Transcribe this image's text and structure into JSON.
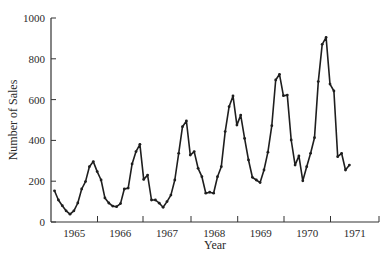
{
  "chart_data": {
    "type": "line",
    "title": "",
    "xlabel": "Year",
    "ylabel": "Number of Sales",
    "ylim": [
      0,
      1000
    ],
    "yticks": [
      0,
      200,
      400,
      600,
      800,
      1000
    ],
    "ytick_labels": [
      "0",
      "200",
      "400",
      "600",
      "800",
      "1000"
    ],
    "xtick_labels": [
      "1965",
      "1966",
      "1967",
      "1968",
      "1969",
      "1970",
      "1971"
    ],
    "x_start": "Jan 1965",
    "x_interval": "monthly",
    "grid": false,
    "legend": null,
    "colors": {
      "line": "#1e1e1e",
      "axis": "#333333"
    },
    "series": [
      {
        "name": "Number of Sales",
        "values": [
          153,
          108,
          80,
          55,
          38,
          55,
          93,
          162,
          198,
          271,
          296,
          247,
          206,
          118,
          93,
          78,
          75,
          90,
          162,
          166,
          285,
          345,
          381,
          209,
          230,
          108,
          108,
          92,
          72,
          100,
          132,
          206,
          337,
          467,
          495,
          328,
          345,
          263,
          222,
          141,
          146,
          141,
          222,
          271,
          443,
          565,
          618,
          475,
          524,
          410,
          304,
          219,
          206,
          193,
          255,
          342,
          472,
          696,
          724,
          619,
          622,
          402,
          279,
          324,
          202,
          271,
          337,
          413,
          688,
          871,
          905,
          676,
          642,
          320,
          337,
          255,
          279
        ]
      }
    ]
  }
}
